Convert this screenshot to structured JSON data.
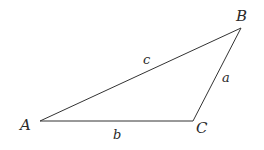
{
  "diagram": {
    "type": "triangle",
    "vertices": {
      "A": {
        "label": "A"
      },
      "B": {
        "label": "B"
      },
      "C": {
        "label": "C"
      }
    },
    "sides": {
      "a": {
        "label": "a",
        "between": "B-C"
      },
      "b": {
        "label": "b",
        "between": "A-C"
      },
      "c": {
        "label": "c",
        "between": "A-B"
      }
    },
    "colors": {
      "stroke": "#333333",
      "text": "#2a2a2a",
      "background": "#ffffff"
    }
  }
}
